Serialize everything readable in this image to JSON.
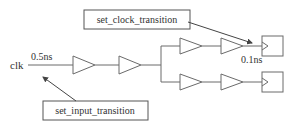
{
  "diagram": {
    "input_port": {
      "label": "clk"
    },
    "input_transition": {
      "value_label": "0.5ns"
    },
    "clock_transition": {
      "value_label": "0.1ns"
    },
    "callouts": {
      "set_clock_transition": {
        "label": "set_clock_transition"
      },
      "set_input_transition": {
        "label": "set_input_transition"
      }
    },
    "elements": {
      "main_buffers": 2,
      "branches": [
        {
          "name": "upper",
          "buffers": 2,
          "endpoint": "flip-flop"
        },
        {
          "name": "lower",
          "buffers": 2,
          "endpoint": "flip-flop"
        }
      ]
    },
    "colors": {
      "line": "#6a6a6a",
      "text": "#333333",
      "box_border": "#555555",
      "background": "#ffffff"
    }
  }
}
